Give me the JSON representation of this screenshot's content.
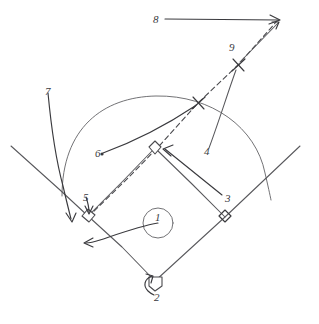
{
  "diagram": {
    "style": "hand-drawn pencil sketch",
    "ink_color": "#58585c",
    "background_color": "#ffffff",
    "width": 319,
    "height": 324
  },
  "labels": [
    {
      "id": "1",
      "text": "1",
      "x": 155,
      "y": 212,
      "note": "pitcher's mound circle"
    },
    {
      "id": "2",
      "text": "2",
      "x": 154,
      "y": 292,
      "note": "home plate"
    },
    {
      "id": "3",
      "text": "3",
      "x": 225,
      "y": 193,
      "note": "throw to second base"
    },
    {
      "id": "4",
      "text": "4",
      "x": 204,
      "y": 146,
      "note": "line to upper X mark"
    },
    {
      "id": "5",
      "text": "5",
      "x": 83,
      "y": 192,
      "note": "third base"
    },
    {
      "id": "6",
      "text": "6",
      "x": 95,
      "y": 148,
      "note": "curved path to X mark"
    },
    {
      "id": "7",
      "text": "7",
      "x": 45,
      "y": 86,
      "note": "left foul territory arrow"
    },
    {
      "id": "8",
      "text": "8",
      "x": 153,
      "y": 14,
      "note": "horizontal line to apex"
    },
    {
      "id": "9",
      "text": "9",
      "x": 229,
      "y": 42,
      "note": "upper X mark"
    }
  ],
  "field_elements": {
    "outfield_arc": "semicircular outfield fence arc",
    "left_foul_line": "foul line extending from home plate past third base to upper-left",
    "right_foul_line": "foul line extending from home plate past first base to upper-right",
    "infield_diamond": "home plate, first base, second base, third base",
    "dashed_trajectory": "dashed ball flight path from third base through second base out past the outfield arc",
    "right_angle_markers": 3,
    "x_marks": 2,
    "arrowheads": 7
  }
}
